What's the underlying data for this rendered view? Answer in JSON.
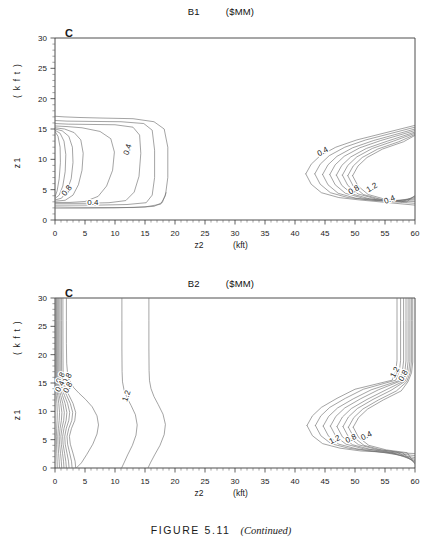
{
  "figure": {
    "caption_main": "FIGURE 5.11",
    "caption_note": "(Continued)"
  },
  "panels": [
    {
      "id": "b1",
      "letter": "C",
      "title_left": "B1",
      "title_right": "($MM)",
      "xlabel": "z2",
      "xunit": "(kft)",
      "ylabel": "z1",
      "yunit": "( k f t )",
      "xticks": [
        "0",
        "5",
        "10",
        "15",
        "20",
        "25",
        "30",
        "35",
        "40",
        "45",
        "50",
        "55",
        "60"
      ],
      "yticks": [
        "0",
        "5",
        "10",
        "15",
        "20",
        "25",
        "30"
      ]
    },
    {
      "id": "b2",
      "letter": "C",
      "title_left": "B2",
      "title_right": "($MM)",
      "xlabel": "z2",
      "xunit": "(kft)",
      "ylabel": "z1",
      "yunit": "( k f t )",
      "xticks": [
        "0",
        "5",
        "10",
        "15",
        "20",
        "25",
        "30",
        "35",
        "40",
        "45",
        "50",
        "55",
        "60"
      ],
      "yticks": [
        "0",
        "5",
        "10",
        "15",
        "20",
        "25",
        "30"
      ]
    }
  ],
  "chart_data": [
    {
      "type": "contour",
      "title": "B1   ($MM)",
      "xlabel": "z2 (kft)",
      "ylabel": "z1 (kft)",
      "xlim": [
        0,
        60
      ],
      "ylim": [
        0,
        30
      ],
      "xtick_values": [
        0,
        5,
        10,
        15,
        20,
        25,
        30,
        35,
        40,
        45,
        50,
        55,
        60
      ],
      "ytick_values": [
        0,
        5,
        10,
        15,
        20,
        25,
        30
      ],
      "minor_tick_step": 1,
      "grid": false,
      "legend": "none",
      "contour_levels": [
        0.4,
        0.8,
        1.2,
        1.6,
        2.0,
        2.4
      ],
      "contour_labels": [
        {
          "text": "0.4",
          "x": 12.5,
          "y": 11.5,
          "rotation": -72
        },
        {
          "text": "0.8",
          "x": 2.3,
          "y": 4.6,
          "rotation": -52
        },
        {
          "text": "0.4",
          "x": 6.3,
          "y": 2.4,
          "rotation": 0
        },
        {
          "text": "0.4",
          "x": 44.8,
          "y": 10.9,
          "rotation": -28
        },
        {
          "text": "0.8",
          "x": 50.0,
          "y": 4.6,
          "rotation": -30
        },
        {
          "text": "1.2",
          "x": 53.0,
          "y": 5.0,
          "rotation": -30
        },
        {
          "text": "0.4",
          "x": 55.9,
          "y": 3.0,
          "rotation": -22
        }
      ],
      "description": "Two contour lobes: a left lobe closing between z2=0-19 for z1=2-17, and a right lobe opening from z2=42 toward z2=60 centred near z1=7."
    },
    {
      "type": "contour",
      "title": "B2   ($MM)",
      "xlabel": "z2 (kft)",
      "ylabel": "z1 (kft)",
      "xlim": [
        0,
        60
      ],
      "ylim": [
        0,
        30
      ],
      "xtick_values": [
        0,
        5,
        10,
        15,
        20,
        25,
        30,
        35,
        40,
        45,
        50,
        55,
        60
      ],
      "ytick_values": [
        0,
        5,
        10,
        15,
        20,
        25,
        30
      ],
      "minor_tick_step": 1,
      "grid": false,
      "legend": "none",
      "contour_levels": [
        0.4,
        0.8,
        1.2,
        1.6,
        2.0,
        2.4
      ],
      "contour_labels": [
        {
          "text": "0.8",
          "x": 1.3,
          "y": 15.7,
          "rotation": -62
        },
        {
          "text": "0.8",
          "x": 2.4,
          "y": 15.6,
          "rotation": -62
        },
        {
          "text": "0.4",
          "x": 1.2,
          "y": 14.2,
          "rotation": -62
        },
        {
          "text": "0.8",
          "x": 2.5,
          "y": 14.0,
          "rotation": -62
        },
        {
          "text": "1.2",
          "x": 12.3,
          "y": 12.6,
          "rotation": -72
        },
        {
          "text": "1.2",
          "x": 57.0,
          "y": 16.7,
          "rotation": -62
        },
        {
          "text": "0.8",
          "x": 58.4,
          "y": 16.1,
          "rotation": -62
        },
        {
          "text": "1.2",
          "x": 46.8,
          "y": 4.6,
          "rotation": -26
        },
        {
          "text": "0.8",
          "x": 49.5,
          "y": 4.8,
          "rotation": -26
        },
        {
          "text": "0.4",
          "x": 52.1,
          "y": 5.3,
          "rotation": -26
        }
      ],
      "description": "Left contour bundle hugging z2=0-4 rising to the top of the frame, two near-vertical contours at z2~11 and z2~15.5 spanning the full z1 range, and a right lobe opening from z2=42 with near-vertical branches at z2~57-59."
    }
  ]
}
